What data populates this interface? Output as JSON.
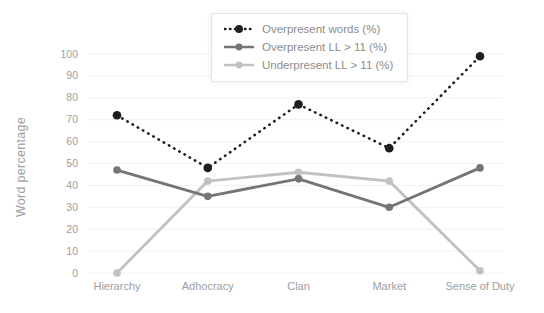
{
  "chart_data": {
    "type": "line",
    "title": "",
    "ylabel": "Word percentage",
    "xlabel": "",
    "ylim": [
      0,
      100
    ],
    "ytick_step": 10,
    "grid": true,
    "legend_position": "top-center",
    "categories": [
      "Hierarchy",
      "Adhocracy",
      "Clan",
      "Market",
      "Sense of Duty"
    ],
    "series": [
      {
        "name": "Overpresent words (%)",
        "values": [
          72,
          48,
          77,
          57,
          99
        ],
        "color": "#1f1f1f",
        "style": "dotted"
      },
      {
        "name": "Overpresent LL > 11 (%)",
        "values": [
          47,
          35,
          43,
          30,
          48
        ],
        "color": "#757575",
        "style": "solid"
      },
      {
        "name": "Underpresent LL > 11 (%)",
        "values": [
          0,
          42,
          46,
          42,
          1
        ],
        "color": "#c1c1c1",
        "style": "solid"
      }
    ]
  },
  "colors": {
    "background": "#ffffff",
    "grid": "#f1f1f1",
    "axis_text": "#9e9e9e",
    "legend_text": "#8c8c8c",
    "legend_border": "#e4e4e4"
  }
}
